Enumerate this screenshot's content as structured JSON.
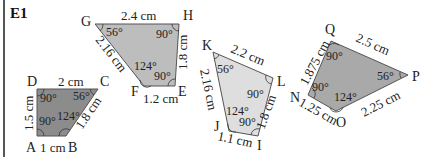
{
  "exercise_label": "E1",
  "colors": {
    "quad_abcd": "#8c8c8c",
    "quad_efgh": "#bdbdbd",
    "quad_ijkl": "#dedede",
    "quad_nopq": "#a9a9a9",
    "stroke": "#555555"
  },
  "shapes": [
    {
      "name": "ABCD",
      "vertices": {
        "A": "A",
        "B": "B",
        "C": "C",
        "D": "D"
      },
      "sides": {
        "DC": "2 cm",
        "AD": "1.5 cm",
        "AB": "1 cm",
        "BC": "1.8 cm"
      },
      "angles": {
        "D": "90°",
        "C": "56°",
        "B": "124°",
        "A": "90°"
      }
    },
    {
      "name": "EFGH",
      "vertices": {
        "E": "E",
        "F": "F",
        "G": "G",
        "H": "H"
      },
      "sides": {
        "GH": "2.4 cm",
        "HE": "1.8 cm",
        "FE": "1.2 cm",
        "GF": "2.16 cm"
      },
      "angles": {
        "G": "56°",
        "H": "90°",
        "F": "124°",
        "E": "90°"
      }
    },
    {
      "name": "IJKL",
      "vertices": {
        "I": "I",
        "J": "J",
        "K": "K",
        "L": "L"
      },
      "sides": {
        "KL": "2.2 cm",
        "LI": "1.8 cm",
        "JI": "1.1 cm",
        "KJ": "2.16 cm"
      },
      "angles": {
        "K": "56°",
        "L": "90°",
        "J": "124°",
        "I": "90°"
      }
    },
    {
      "name": "NOPQ",
      "vertices": {
        "N": "N",
        "O": "O",
        "P": "P",
        "Q": "Q"
      },
      "sides": {
        "QP": "2.5 cm",
        "OP": "2.25 cm",
        "NO": "1.25 cm",
        "NQ": "1.875 cm"
      },
      "angles": {
        "Q": "90°",
        "P": "56°",
        "O": "124°",
        "N": "90°"
      }
    }
  ]
}
